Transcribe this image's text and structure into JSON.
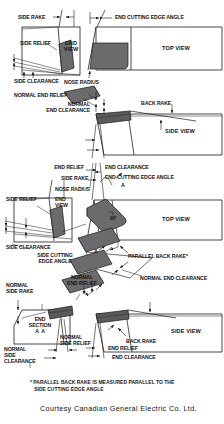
{
  "figure": {
    "colors": {
      "line": "#1a1a1a",
      "insert_fill": "#6b6b6b",
      "insert_fill_dark": "#4a4a4a",
      "background": "#ffffff",
      "text": "#141414"
    },
    "panels": {
      "top_view_1": "TOP VIEW",
      "top_view_2": "TOP VIEW",
      "side_view_1": "SIDE VIEW",
      "side_view_2": "SIDE VIEW",
      "end_view_1": "END\nVIEW",
      "end_view_2": "END\nVIEW",
      "end_section": "END\nSECTION\nA  A"
    },
    "labels": {
      "side_rake_1": "SIDE RAKE",
      "side_relief_1": "SIDE RELIEF",
      "side_clearance_1": "SIDE CLEARANCE",
      "end_cutting_edge_angle_1": "END CUTTING EDGE ANGLE",
      "nose_radius_1": "NOSE RADIUS",
      "normal_end_relief_1": "NORMAL END RELIEF",
      "normal_end_clearance_1": "NORMAL\nEND CLEARANCE",
      "back_rake_1": "BACK RAKE",
      "end_relief_2": "END RELIEF",
      "end_clearance_2": "END CLEARANCE",
      "side_rake_2": "SIDE RAKE",
      "nose_radius_2": "NOSE RADIUS",
      "end_cutting_edge_angle_2": "END CUTTING EDGE ANGLE",
      "side_relief_2": "SIDE RELIEF",
      "side_clearance_2": "SIDE CLEARANCE",
      "side_cutting_edge_angle": "SIDE CUTTING\nEDGE ANGLE",
      "angle_90": "90°",
      "section_arrow_a_top": "A",
      "section_arrow_a_bottom": "A",
      "parallel_back_rake": "PARALLEL BACK RAKE*",
      "normal_end_relief_2": "NORMAL\nEND RELIEF",
      "normal_end_clearance_2": "NORMAL END CLEARANCE",
      "normal_side_rake": "NORMAL\nSIDE RAKE",
      "normal_side_relief": "NORMAL\nSIDE RELIEF",
      "normal_side_clearance": "NORMAL\nSIDE\nCLEARANCE",
      "back_rake_2": "BACK RAKE",
      "end_relief_3": "END RELIEF",
      "end_clearance_3": "END CLEARANCE"
    },
    "footnote": "* PARALLEL BACK RAKE IS MEASURED PARALLEL TO THE\n   SIDE CUTTING EDGE ANGLE",
    "credit": "Courtesy Canadian General Electric Co. Ltd."
  }
}
